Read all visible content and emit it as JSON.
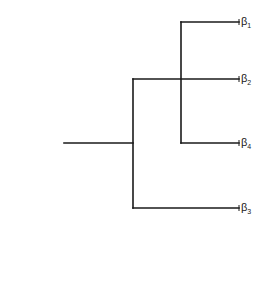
{
  "diagram": {
    "type": "dendrogram",
    "stroke_color": "#1a1a1a",
    "leaves": [
      {
        "id": "b1",
        "symbol": "β",
        "subscript": "1",
        "x": 239,
        "y": 22
      },
      {
        "id": "b2",
        "symbol": "β",
        "subscript": "2",
        "x": 239,
        "y": 79
      },
      {
        "id": "b4",
        "symbol": "β",
        "subscript": "4",
        "x": 239,
        "y": 143
      },
      {
        "id": "b3",
        "symbol": "β",
        "subscript": "3",
        "x": 239,
        "y": 208
      }
    ],
    "segments": [
      {
        "name": "root-stem",
        "x1": 64,
        "y1": 143,
        "x2": 133,
        "y2": 143
      },
      {
        "name": "outer-split",
        "x1": 133,
        "y1": 79,
        "x2": 133,
        "y2": 208
      },
      {
        "name": "branch-b2",
        "x1": 133,
        "y1": 79,
        "x2": 239,
        "y2": 79
      },
      {
        "name": "branch-b3",
        "x1": 133,
        "y1": 208,
        "x2": 239,
        "y2": 208
      },
      {
        "name": "inner-split",
        "x1": 181,
        "y1": 22,
        "x2": 181,
        "y2": 143
      },
      {
        "name": "branch-b1",
        "x1": 181,
        "y1": 22,
        "x2": 239,
        "y2": 22
      },
      {
        "name": "branch-b4",
        "x1": 181,
        "y1": 143,
        "x2": 239,
        "y2": 143
      }
    ]
  }
}
